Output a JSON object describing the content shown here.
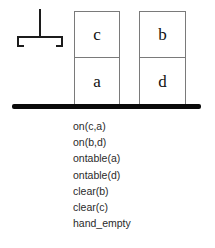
{
  "scene": {
    "gripper": {
      "icon": "robot-gripper-icon",
      "label": "robot hand (empty)"
    },
    "stacks": [
      {
        "name": "left-stack",
        "blocks": [
          {
            "label": "c"
          },
          {
            "label": "a"
          }
        ]
      },
      {
        "name": "right-stack",
        "blocks": [
          {
            "label": "b"
          },
          {
            "label": "d"
          }
        ]
      }
    ],
    "table": {
      "label": "table surface",
      "color": "#0a0a0a"
    }
  },
  "predicates": [
    "on(c,a)",
    "on(b,d)",
    "ontable(a)",
    "ontable(d)",
    "clear(b)",
    "clear(c)",
    "hand_empty"
  ]
}
